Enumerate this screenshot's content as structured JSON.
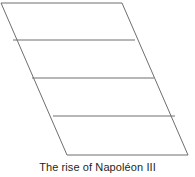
{
  "figure": {
    "caption": "The rise of Napoléon III",
    "background_color": "#ffffff",
    "stroke_color": "#6e6e6e",
    "caption_color": "#231f20",
    "width": 195,
    "height": 177
  },
  "chart_data": {
    "type": "diagram",
    "title": "The rise of Napoléon III",
    "shape": "parallelogram",
    "band_count": 4,
    "divider_count": 3,
    "outline": {
      "points": [
        {
          "name": "top-left",
          "x": 1,
          "y": 3
        },
        {
          "name": "top-right",
          "x": 122,
          "y": 3
        },
        {
          "name": "bottom-right",
          "x": 188,
          "y": 155
        },
        {
          "name": "bottom-left",
          "x": 67,
          "y": 155
        }
      ]
    },
    "dividers": [
      {
        "index": 1,
        "x1": 13,
        "y1": 40,
        "x2": 135,
        "y2": 40
      },
      {
        "index": 2,
        "x1": 32,
        "y1": 78,
        "x2": 154,
        "y2": 78
      },
      {
        "index": 3,
        "x1": 53,
        "y1": 116,
        "x2": 175,
        "y2": 116
      }
    ],
    "bands": [
      {
        "index": 1,
        "label": ""
      },
      {
        "index": 2,
        "label": ""
      },
      {
        "index": 3,
        "label": ""
      },
      {
        "index": 4,
        "label": ""
      }
    ],
    "xlabel": "",
    "ylabel": "",
    "grid": false,
    "legend": null
  }
}
